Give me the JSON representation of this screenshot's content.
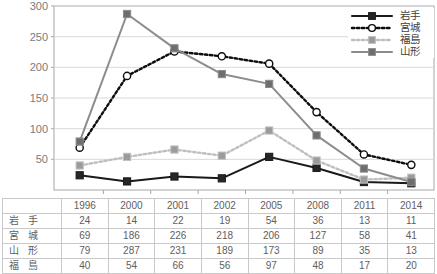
{
  "chart_data": {
    "type": "line",
    "title": "",
    "xlabel": "",
    "ylabel": "",
    "categories": [
      "1996",
      "2000",
      "2001",
      "2002",
      "2005",
      "2008",
      "2011",
      "2014"
    ],
    "ylim": [
      0,
      300
    ],
    "yticks": [
      50,
      100,
      150,
      200,
      250,
      300
    ],
    "grid": true,
    "legend_position": "top-right",
    "series": [
      {
        "name": "岩手",
        "values": [
          24,
          14,
          22,
          19,
          54,
          36,
          13,
          11
        ],
        "color": "#1a1a1a",
        "line_style": "solid",
        "marker": "square",
        "marker_fill": "#262626"
      },
      {
        "name": "宮城",
        "values": [
          69,
          186,
          226,
          218,
          206,
          127,
          58,
          41
        ],
        "color": "#0d0d0d",
        "line_style": "dotted",
        "marker": "circle",
        "marker_fill": "#ffffff"
      },
      {
        "name": "福島",
        "values": [
          40,
          54,
          66,
          56,
          97,
          48,
          17,
          20
        ],
        "color": "#bfbfbf",
        "line_style": "dotted",
        "marker": "square",
        "marker_fill": "#9b9b9b"
      },
      {
        "name": "山形",
        "values": [
          79,
          287,
          231,
          189,
          173,
          89,
          35,
          13
        ],
        "color": "#8c8c8c",
        "line_style": "solid",
        "marker": "square",
        "marker_fill": "#6e6e6e"
      }
    ]
  },
  "legend": {
    "items": [
      {
        "label": "岩手"
      },
      {
        "label": "宮城"
      },
      {
        "label": "福島"
      },
      {
        "label": "山形"
      }
    ]
  },
  "table": {
    "corner_label": "",
    "column_headers": [
      "1996",
      "2000",
      "2001",
      "2002",
      "2005",
      "2008",
      "2011",
      "2014"
    ],
    "rows": [
      {
        "label": "岩 手",
        "values": [
          "24",
          "14",
          "22",
          "19",
          "54",
          "36",
          "13",
          "11"
        ]
      },
      {
        "label": "宮 城",
        "values": [
          "69",
          "186",
          "226",
          "218",
          "206",
          "127",
          "58",
          "41"
        ]
      },
      {
        "label": "山 形",
        "values": [
          "79",
          "287",
          "231",
          "189",
          "173",
          "89",
          "35",
          "13"
        ]
      },
      {
        "label": "福 島",
        "values": [
          "40",
          "54",
          "66",
          "56",
          "97",
          "48",
          "17",
          "20"
        ]
      }
    ]
  },
  "axis": {
    "y_tick_labels": [
      "300",
      "250",
      "200",
      "150",
      "100",
      "50"
    ]
  },
  "colors": {
    "iwate": "#1a1a1a",
    "miyagi": "#0d0d0d",
    "fukushima": "#bfbfbf",
    "yamagata": "#8c8c8c",
    "gridline": "#d9d9d9",
    "axis": "#a6a6a6",
    "table_border": "#c9c9c9",
    "text": "#5e5e5e"
  }
}
